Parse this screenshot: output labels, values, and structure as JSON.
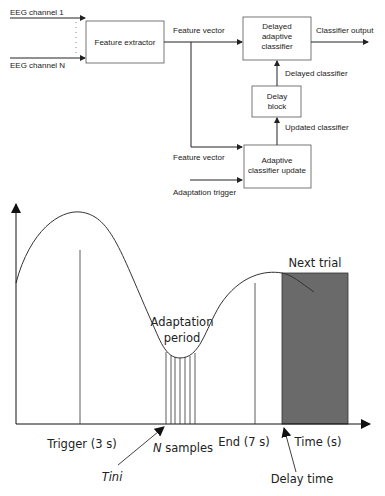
{
  "block_diagram": {
    "inputs": {
      "channel_first": "EEG channel 1",
      "channel_last": "EEG channel N"
    },
    "blocks": {
      "feature_extractor": "Feature extractor",
      "delayed_classifier": [
        "Delayed",
        "adaptive",
        "classifier"
      ],
      "delay_block": [
        "Delay",
        "block"
      ],
      "adaptive_update": [
        "Adaptive",
        "classifier update"
      ]
    },
    "signals": {
      "feature_vector_top": "Feature vector",
      "classifier_output": "Classifier output",
      "delayed_classifier": "Delayed classifier",
      "updated_classifier": "Updated classifier",
      "feature_vector_bottom": "Feature vector",
      "adaptation_trigger": "Adaptation trigger"
    }
  },
  "timeline": {
    "adaptation_period": [
      "Adaptation",
      "period"
    ],
    "next_trial": "Next trial",
    "trigger": "Trigger (3 s)",
    "n_samples_italic": "N",
    "n_samples_rest": " samples",
    "end": "End (7 s)",
    "time_axis": "Time (s)",
    "tini": "Tini",
    "delay_time": "Delay time",
    "colors": {
      "next_trial_fill": "#6a6a6a",
      "line": "#333333"
    }
  }
}
